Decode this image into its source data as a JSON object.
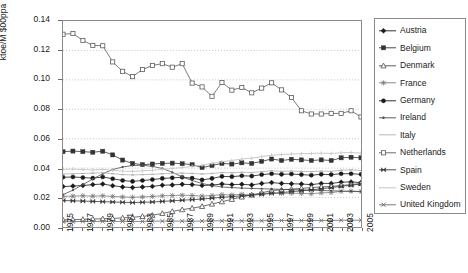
{
  "chart_data": {
    "type": "line",
    "title": "",
    "xlabel": "",
    "ylabel": "ktoe/M $00ppa",
    "ylim": [
      0.0,
      0.14
    ],
    "yticks": [
      "0.00",
      "0.02",
      "0.04",
      "0.06",
      "0.08",
      "0.10",
      "0.12",
      "0.14"
    ],
    "ytick_values": [
      0.0,
      0.02,
      0.04,
      0.06,
      0.08,
      0.1,
      0.12,
      0.14
    ],
    "xlim": [
      1975,
      2005
    ],
    "grid": "horizontal-dotted",
    "legend_position": "right-outside",
    "x": [
      1975,
      1976,
      1977,
      1978,
      1979,
      1980,
      1981,
      1982,
      1983,
      1984,
      1985,
      1986,
      1987,
      1988,
      1989,
      1990,
      1991,
      1992,
      1993,
      1994,
      1995,
      1996,
      1997,
      1998,
      1999,
      2000,
      2001,
      2002,
      2003,
      2004,
      2005
    ],
    "xtick_labels": [
      "1975",
      "1977",
      "1979",
      "1981",
      "1983",
      "1985",
      "1987",
      "1989",
      "1991",
      "1993",
      "1995",
      "1997",
      "1999",
      "2001",
      "2003",
      "2005"
    ],
    "xtick_label_years": [
      1975,
      1977,
      1979,
      1981,
      1983,
      1985,
      1987,
      1989,
      1991,
      1993,
      1995,
      1997,
      1999,
      2001,
      2003,
      2005
    ],
    "series": [
      {
        "name": "Austria",
        "marker": "filled-diamond",
        "color": "#1a1a1a",
        "values": [
          0.0275,
          0.0278,
          0.0282,
          0.0288,
          0.0292,
          0.0281,
          0.0272,
          0.0268,
          0.0272,
          0.0276,
          0.0284,
          0.0286,
          0.029,
          0.0288,
          0.0282,
          0.0285,
          0.0292,
          0.0288,
          0.029,
          0.0286,
          0.0296,
          0.0302,
          0.0296,
          0.0294,
          0.0292,
          0.0288,
          0.0296,
          0.0296,
          0.0305,
          0.0306,
          0.0302
        ]
      },
      {
        "name": "Belgium",
        "marker": "filled-square",
        "color": "#333333",
        "values": [
          0.0512,
          0.0516,
          0.0512,
          0.0508,
          0.0515,
          0.049,
          0.0455,
          0.0432,
          0.0424,
          0.0428,
          0.0432,
          0.0434,
          0.043,
          0.0424,
          0.0404,
          0.0418,
          0.0432,
          0.0428,
          0.0436,
          0.0432,
          0.0446,
          0.0462,
          0.0452,
          0.046,
          0.0456,
          0.0452,
          0.0456,
          0.0452,
          0.047,
          0.0474,
          0.047
        ]
      },
      {
        "name": "Denmark",
        "marker": "open-triangle",
        "color": "#4a4a4a",
        "values": [
          0.0048,
          0.005,
          0.0052,
          0.0054,
          0.0056,
          0.0058,
          0.0062,
          0.0066,
          0.0072,
          0.008,
          0.0092,
          0.0106,
          0.0118,
          0.0128,
          0.014,
          0.0156,
          0.0172,
          0.0188,
          0.0204,
          0.0218,
          0.0232,
          0.0248,
          0.0252,
          0.0258,
          0.0262,
          0.0268,
          0.0272,
          0.0276,
          0.0282,
          0.0288,
          0.0296
        ]
      },
      {
        "name": "France",
        "marker": "star-cross",
        "color": "#7a7a7a",
        "values": [
          0.0208,
          0.021,
          0.0212,
          0.021,
          0.0212,
          0.0208,
          0.0204,
          0.0202,
          0.0204,
          0.0208,
          0.0212,
          0.0214,
          0.0216,
          0.0214,
          0.021,
          0.0214,
          0.022,
          0.0218,
          0.0222,
          0.0218,
          0.0226,
          0.0232,
          0.0228,
          0.023,
          0.0228,
          0.0226,
          0.0232,
          0.0234,
          0.0242,
          0.0244,
          0.0242
        ]
      },
      {
        "name": "Germany",
        "marker": "filled-circle",
        "color": "#1a1a1a",
        "values": [
          0.0338,
          0.034,
          0.0336,
          0.0332,
          0.034,
          0.0328,
          0.0316,
          0.031,
          0.0316,
          0.0322,
          0.033,
          0.0334,
          0.0338,
          0.0332,
          0.032,
          0.033,
          0.0344,
          0.0342,
          0.0348,
          0.0346,
          0.0356,
          0.0362,
          0.0358,
          0.036,
          0.0356,
          0.0352,
          0.0358,
          0.0356,
          0.0362,
          0.0362,
          0.0358
        ]
      },
      {
        "name": "Ireland",
        "marker": "line-only",
        "color": "#4a4a4a",
        "values": [
          0.022,
          0.025,
          0.0288,
          0.0326,
          0.0362,
          0.039,
          0.0408,
          0.0418,
          0.042,
          0.0412,
          0.0398,
          0.0372,
          0.034,
          0.0316,
          0.0296,
          0.0282,
          0.0272,
          0.0268,
          0.0264,
          0.0262,
          0.026,
          0.0258,
          0.0256,
          0.0254,
          0.0252,
          0.025,
          0.0248,
          0.0246,
          0.0244,
          0.0242,
          0.024
        ]
      },
      {
        "name": "Italy",
        "marker": "line-only-light",
        "color": "#b0b0b0",
        "values": [
          0.036,
          0.0362,
          0.0364,
          0.0366,
          0.0368,
          0.0362,
          0.0356,
          0.0354,
          0.0356,
          0.0358,
          0.0362,
          0.0364,
          0.0366,
          0.0364,
          0.036,
          0.0364,
          0.037,
          0.0368,
          0.0372,
          0.037,
          0.0376,
          0.0382,
          0.0378,
          0.038,
          0.0378,
          0.0376,
          0.038,
          0.0378,
          0.0386,
          0.0388,
          0.0384
        ]
      },
      {
        "name": "Netherlands",
        "marker": "open-square",
        "color": "#5a5a5a",
        "values": [
          0.131,
          0.1315,
          0.1268,
          0.1234,
          0.1232,
          0.1122,
          0.1058,
          0.1022,
          0.107,
          0.1098,
          0.111,
          0.1086,
          0.111,
          0.0978,
          0.0952,
          0.0888,
          0.0982,
          0.093,
          0.0948,
          0.0912,
          0.0944,
          0.098,
          0.0932,
          0.088,
          0.079,
          0.0768,
          0.0768,
          0.0772,
          0.0772,
          0.079,
          0.0748
        ]
      },
      {
        "name": "Spain",
        "marker": "bowtie",
        "color": "#3a3a3a",
        "values": [
          0.018,
          0.0178,
          0.0176,
          0.0174,
          0.0172,
          0.017,
          0.0168,
          0.0166,
          0.0168,
          0.017,
          0.0174,
          0.0178,
          0.0182,
          0.0186,
          0.019,
          0.0196,
          0.0202,
          0.0206,
          0.0212,
          0.0216,
          0.0222,
          0.0228,
          0.0234,
          0.024,
          0.0246,
          0.0252,
          0.026,
          0.0268,
          0.0276,
          0.0284,
          0.0292
        ]
      },
      {
        "name": "Sweden",
        "marker": "line-only-pale",
        "color": "#c8c8c8",
        "values": [
          0.0392,
          0.0394,
          0.039,
          0.0388,
          0.0392,
          0.0386,
          0.038,
          0.0378,
          0.0382,
          0.0386,
          0.0392,
          0.0398,
          0.0404,
          0.0412,
          0.042,
          0.0432,
          0.0444,
          0.0452,
          0.0462,
          0.0468,
          0.0478,
          0.0488,
          0.0492,
          0.0496,
          0.0498,
          0.05,
          0.0502,
          0.05,
          0.0504,
          0.0506,
          0.0502
        ]
      },
      {
        "name": "United Kingdom",
        "marker": "cross-x",
        "color": "#6a6a6a",
        "values": [
          0.0036,
          0.0036,
          0.0038,
          0.0038,
          0.0038,
          0.0038,
          0.0038,
          0.0038,
          0.0038,
          0.004,
          0.004,
          0.004,
          0.004,
          0.004,
          0.004,
          0.0042,
          0.0042,
          0.0042,
          0.0042,
          0.0042,
          0.0042,
          0.0044,
          0.0044,
          0.0044,
          0.0044,
          0.0044,
          0.0044,
          0.0044,
          0.0046,
          0.0046,
          0.0046
        ]
      }
    ]
  },
  "legend": {
    "entries": [
      {
        "label": "Austria"
      },
      {
        "label": "Belgium"
      },
      {
        "label": "Denmark"
      },
      {
        "label": "France"
      },
      {
        "label": "Germany"
      },
      {
        "label": "Ireland"
      },
      {
        "label": "Italy"
      },
      {
        "label": "Netherlands"
      },
      {
        "label": "Spain"
      },
      {
        "label": "Sweden"
      },
      {
        "label": "United Kingdom"
      }
    ]
  }
}
